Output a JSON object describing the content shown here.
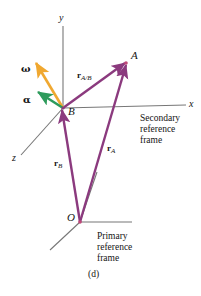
{
  "figure": {
    "caption": "(d)",
    "colors": {
      "vector_purple": "#8B3A7E",
      "omega_orange": "#F0A830",
      "alpha_green": "#2E9B5C",
      "axis_gray": "#777777",
      "text_black": "#141414"
    }
  },
  "axes": {
    "y_label": "y",
    "x_label": "x",
    "z_label": "z"
  },
  "points": {
    "A": "A",
    "B": "B",
    "O": "O"
  },
  "vectors": {
    "r_AB": {
      "bold": "r",
      "sub": "A/B"
    },
    "r_A": {
      "bold": "r",
      "sub": "A"
    },
    "r_B": {
      "bold": "r",
      "sub": "B"
    },
    "omega": "ω",
    "alpha": "α"
  },
  "annotations": {
    "secondary_frame": [
      "Secondary",
      "reference",
      "frame"
    ],
    "primary_frame": [
      "Primary",
      "reference",
      "frame"
    ]
  }
}
